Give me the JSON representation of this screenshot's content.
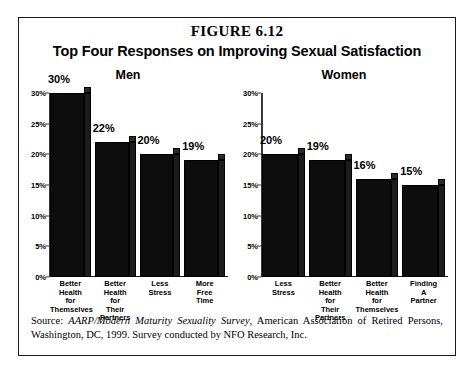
{
  "figure": {
    "number": "FIGURE 6.12",
    "title": "Top Four Responses on Improving Sexual Satisfaction",
    "source_prefix": "Source: ",
    "source_italic": "AARP/Modern Maturity Sexuality Survey",
    "source_rest": ", American Association of Retired Persons, Washington, DC, 1999. Survey conducted by NFO Research, Inc."
  },
  "panels": {
    "men": {
      "title": "Men"
    },
    "women": {
      "title": "Women"
    }
  },
  "axis": {
    "ticks": [
      "30%",
      "25%",
      "20%",
      "15%",
      "10%",
      "5%",
      "0%"
    ]
  },
  "chart_data": [
    {
      "type": "bar",
      "title": "Men",
      "categories": [
        "Better Health for Themselves",
        "Better Health for Their Partners",
        "Less Stress",
        "More Free Time"
      ],
      "category_lines": [
        [
          "Better",
          "Health",
          "for",
          "Themselves"
        ],
        [
          "Better",
          "Health",
          "for",
          "Their",
          "Partners"
        ],
        [
          "Less",
          "Stress"
        ],
        [
          "More",
          "Free",
          "Time"
        ]
      ],
      "values": [
        30,
        22,
        20,
        19
      ],
      "value_labels": [
        "30%",
        "22%",
        "20%",
        "19%"
      ],
      "xlabel": "",
      "ylabel": "",
      "ylim": [
        0,
        30
      ],
      "ytick_values": [
        30,
        25,
        20,
        15,
        10,
        5,
        0
      ],
      "ytick_labels": [
        "30%",
        "25%",
        "20%",
        "15%",
        "10%",
        "5%",
        "0%"
      ],
      "grid": false,
      "legend": false
    },
    {
      "type": "bar",
      "title": "Women",
      "categories": [
        "Less Stress",
        "Better Health for Their Partners",
        "Better Health for Themselves",
        "Finding A Partner"
      ],
      "category_lines": [
        [
          "Less",
          "Stress"
        ],
        [
          "Better",
          "Health",
          "for",
          "Their",
          "Partners"
        ],
        [
          "Better",
          "Health",
          "for",
          "Themselves"
        ],
        [
          "Finding",
          "A",
          "Partner"
        ]
      ],
      "values": [
        20,
        19,
        16,
        15
      ],
      "value_labels": [
        "20%",
        "19%",
        "16%",
        "15%"
      ],
      "xlabel": "",
      "ylabel": "",
      "ylim": [
        0,
        30
      ],
      "ytick_values": [
        30,
        25,
        20,
        15,
        10,
        5,
        0
      ],
      "ytick_labels": [
        "30%",
        "25%",
        "20%",
        "15%",
        "10%",
        "5%",
        "0%"
      ],
      "grid": false,
      "legend": false
    }
  ]
}
